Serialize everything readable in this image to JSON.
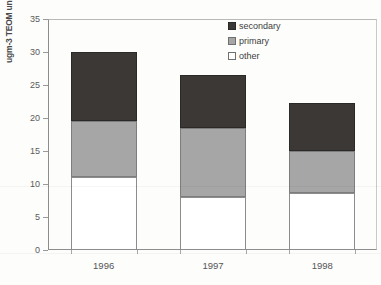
{
  "chart_data": {
    "type": "bar",
    "stacked": true,
    "title": "",
    "subtitle": "",
    "xlabel": "",
    "ylabel": "ugm-3 TEOM units",
    "categories": [
      "1996",
      "1997",
      "1998"
    ],
    "ylim": [
      0,
      35
    ],
    "yticks": [
      0,
      5,
      10,
      15,
      20,
      25,
      30,
      35
    ],
    "ytick_labels": [
      "0",
      "5",
      "10",
      "15",
      "20",
      "25",
      "30",
      "35"
    ],
    "grid": false,
    "legend_position": "top-right",
    "series": [
      {
        "name": "other",
        "color": "#ffffff",
        "values": [
          11.0,
          8.0,
          8.7
        ]
      },
      {
        "name": "primary",
        "color": "#a6a6a6",
        "values": [
          8.5,
          10.5,
          6.3
        ]
      },
      {
        "name": "secondary",
        "color": "#3b3836",
        "values": [
          10.5,
          8.0,
          7.3
        ]
      }
    ],
    "stack_tops": [
      30.0,
      26.5,
      22.3
    ],
    "legend_entries": [
      "secondary",
      "primary",
      "other"
    ]
  }
}
